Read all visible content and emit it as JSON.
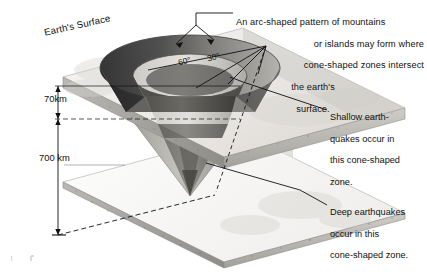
{
  "diagram": {
    "title_labels": {
      "earth_surface": "Earth's Surface"
    },
    "depths": [
      {
        "name": "shallow-boundary",
        "value": "70km"
      },
      {
        "name": "deep-boundary",
        "value": "700 km"
      }
    ],
    "angles": [
      {
        "name": "outer-cone-angle",
        "value": "60°"
      },
      {
        "name": "inner-cone-angle",
        "value": "30°"
      }
    ],
    "annotations": {
      "arc_pattern": {
        "line1": "An arc-shaped pattern of mountains",
        "line2": "or  islands may form where",
        "line3": "cone-shaped zones intersect",
        "line4": "the earth's",
        "line5": "surface."
      },
      "shallow_zone": {
        "line1": "Shallow earth-",
        "line2": "quakes occur in",
        "line3": "this cone-shaped",
        "line4": "zone."
      },
      "deep_zone": {
        "line1": "Deep earthquakes",
        "line2": "occur in this",
        "line3": "cone-shaped zone."
      }
    },
    "colors": {
      "ink": "#111111",
      "slab_top": "#efeeec",
      "slab_edge": "#b8b6b2",
      "cone_dark": "#3a3a3a",
      "cone_mid": "#8d8b87",
      "cone_light": "#d8d6d2",
      "background": "#ffffff"
    }
  }
}
